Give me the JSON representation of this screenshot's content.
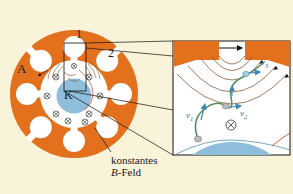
{
  "figure": {
    "title_text": "Magnetron cross section with inset detail",
    "background_color": "#f8f3d9",
    "anode_color": "#e3701d",
    "cathode_color": "#8fbedc",
    "electron_path_color": "#4f8f5c",
    "velocity_label_color": "#2f6f9e",
    "field_line_color": "#6b4a2f",
    "leader_line_color": "#1a1a1a"
  },
  "left_view": {
    "anode_label": "A",
    "cathode_label": "K",
    "cavity_label_1": "1",
    "cavity_label_2": "2",
    "caption_line_1": "konstantes",
    "caption_line_2_italic": "B",
    "caption_line_2_rest": "-Feld",
    "field_symbol": "⊗",
    "field_symbol_count": 9,
    "cavity_count": 8
  },
  "inset_view": {
    "velocity_1": "v",
    "velocity_1_sub": "1",
    "velocity_2": "v",
    "velocity_2_sub": "2",
    "velocity_3": "v",
    "velocity_3_sub": "3",
    "field_symbol": "⊗",
    "border_color": "#1a1a1a"
  }
}
